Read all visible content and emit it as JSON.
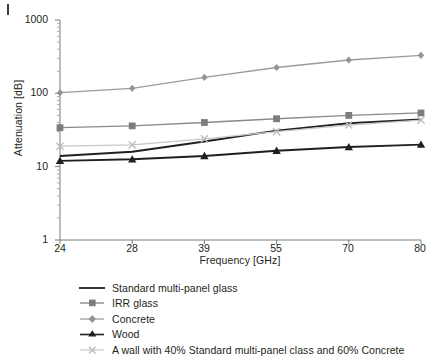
{
  "chart_data": {
    "type": "line",
    "title": "",
    "subtitle": "",
    "xlabel": "Frequency [GHz]",
    "ylabel": "Attenuation [dB]",
    "x_is_categorical": true,
    "categories": [
      "24",
      "28",
      "39",
      "55",
      "70",
      "80"
    ],
    "y_scale": "log",
    "ylim": [
      1,
      1000
    ],
    "y_ticks": [
      "1",
      "10",
      "100",
      "1000"
    ],
    "y_minor_ticks": true,
    "grid": false,
    "legend_position": "below",
    "series": [
      {
        "name": "Standard multi-panel glass",
        "color": "#231f20",
        "marker": "none",
        "values": [
          14,
          16,
          22,
          31,
          39,
          44
        ]
      },
      {
        "name": "IRR glass",
        "color": "#8a8a8a",
        "marker": "square",
        "values": [
          34,
          36,
          40,
          45,
          50,
          54
        ]
      },
      {
        "name": "Concrete",
        "color": "#9c9c9c",
        "marker": "diamond",
        "values": [
          102,
          117,
          165,
          225,
          285,
          330
        ]
      },
      {
        "name": "Wood",
        "color": "#231f20",
        "marker": "triangle",
        "values": [
          12,
          12.6,
          14,
          16.5,
          18.5,
          20
        ]
      },
      {
        "name": "A wall with 40% Standard multi-panel class and 60% Concrete",
        "color": "#c8c8c8",
        "marker": "x",
        "values": [
          19,
          19.8,
          24,
          30,
          37,
          43
        ]
      }
    ]
  },
  "axes": {
    "y_title": "Attenuation [dB]",
    "x_title": "Frequency [GHz]",
    "y_tick_labels": [
      "1000",
      "100",
      "10",
      "1"
    ],
    "x_tick_labels": [
      "24",
      "28",
      "39",
      "55",
      "70",
      "80"
    ]
  },
  "legend": {
    "items": [
      {
        "label": "Standard multi-panel glass",
        "marker": "line-icon"
      },
      {
        "label": "IRR glass",
        "marker": "square-marker-icon"
      },
      {
        "label": "Concrete",
        "marker": "diamond-marker-icon"
      },
      {
        "label": "Wood",
        "marker": "triangle-marker-icon"
      },
      {
        "label": "A wall with 40% Standard multi-panel class and 60% Concrete",
        "marker": "x-marker-icon"
      }
    ]
  },
  "colors": {
    "axis": "#6e6e6e",
    "text": "#231f20",
    "standard_glass": "#231f20",
    "irr_glass": "#8a8a8a",
    "concrete": "#9c9c9c",
    "wood": "#231f20",
    "wall_mix": "#c8c8c8",
    "background": "#ffffff"
  }
}
